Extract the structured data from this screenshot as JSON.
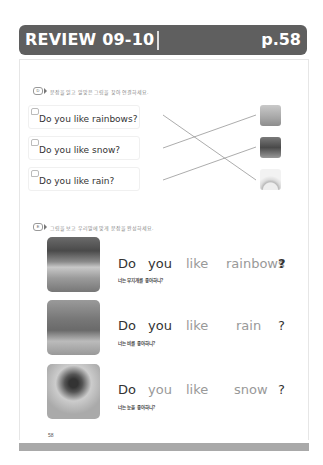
{
  "header": {
    "title": "REVIEW 09-10",
    "page": "p.58"
  },
  "section_d": {
    "badge": "D",
    "instruction": "문장을 읽고 알맞은 그림을 찾아 연결하세요.",
    "questions": [
      {
        "text": "Do you like rainbows?"
      },
      {
        "text": "Do you like snow?"
      },
      {
        "text": "Do you like rain?"
      }
    ],
    "pictures": [
      {
        "icon": "rain-picture"
      },
      {
        "icon": "snow-picture"
      },
      {
        "icon": "rainbow-picture"
      }
    ]
  },
  "section_e": {
    "badge": "E",
    "instruction": "그림을 보고 우리말에 맞게 문장을 완성하세요.",
    "items": [
      {
        "w1": "Do",
        "w2": "you",
        "w3": "like",
        "w4": "rainbows",
        "q": "?",
        "korean": "너는 무지개를 좋아하니?"
      },
      {
        "w1": "Do",
        "w2": "you",
        "w3": "like",
        "w4": "rain",
        "q": "?",
        "korean": "너는 비를 좋아하니?"
      },
      {
        "w1": "Do",
        "w2": "you",
        "w3": "like",
        "w4": "snow",
        "q": "?",
        "korean": "너는 눈을 좋아하니?"
      }
    ]
  },
  "footer": {
    "page_number": "58"
  }
}
